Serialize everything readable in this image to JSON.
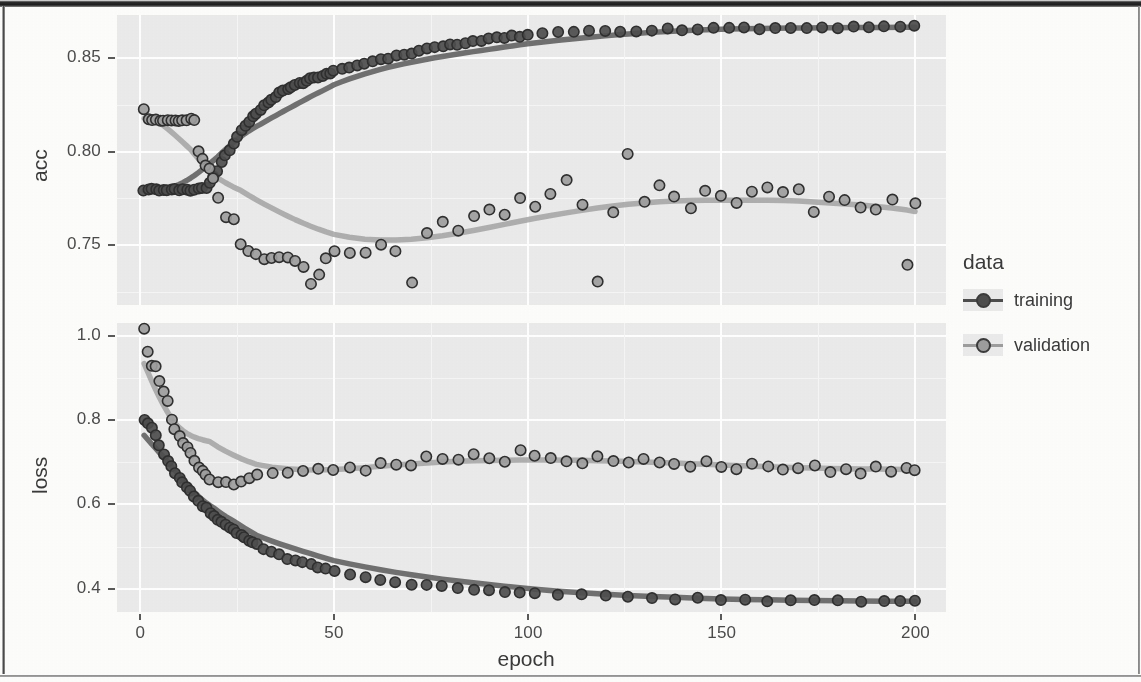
{
  "chart_data": {
    "type": "scatter",
    "title": "",
    "xlabel": "epoch",
    "facets": [
      {
        "name": "acc",
        "ylabel": "acc",
        "yticks": [
          "0.85",
          "0.80",
          "0.75"
        ],
        "ytick_values": [
          0.85,
          0.8,
          0.75
        ],
        "ylim": [
          0.718,
          0.873
        ],
        "series": [
          {
            "name": "training",
            "color": "#4d4d4d",
            "x": [
              1,
              2,
              3,
              4,
              5,
              6,
              7,
              8,
              9,
              10,
              11,
              12,
              13,
              14,
              15,
              16,
              17,
              18,
              19,
              20,
              21,
              22,
              23,
              24,
              25,
              26,
              27,
              28,
              29,
              30,
              31,
              32,
              33,
              34,
              35,
              36,
              37,
              38,
              39,
              40,
              41,
              42,
              43,
              44,
              45,
              46,
              47,
              48,
              49,
              50,
              52,
              54,
              56,
              58,
              60,
              62,
              64,
              66,
              68,
              70,
              72,
              74,
              76,
              78,
              80,
              82,
              84,
              86,
              88,
              90,
              92,
              94,
              96,
              98,
              100,
              104,
              108,
              112,
              116,
              120,
              124,
              128,
              132,
              136,
              140,
              144,
              148,
              152,
              156,
              160,
              164,
              168,
              172,
              176,
              180,
              184,
              188,
              192,
              196,
              200
            ],
            "y": [
              0.7795,
              0.7795,
              0.7795,
              0.7795,
              0.7795,
              0.7795,
              0.7795,
              0.7795,
              0.7795,
              0.7795,
              0.7795,
              0.7796,
              0.7797,
              0.7798,
              0.78,
              0.7803,
              0.781,
              0.7833,
              0.7866,
              0.79,
              0.7945,
              0.7984,
              0.801,
              0.804,
              0.8073,
              0.811,
              0.8135,
              0.8162,
              0.8185,
              0.8205,
              0.8228,
              0.8248,
              0.8265,
              0.828,
              0.8298,
              0.8312,
              0.8325,
              0.8336,
              0.8345,
              0.8354,
              0.8362,
              0.837,
              0.8378,
              0.8386,
              0.8392,
              0.8398,
              0.8405,
              0.8412,
              0.842,
              0.8428,
              0.844,
              0.8452,
              0.846,
              0.847,
              0.8478,
              0.8488,
              0.85,
              0.8512,
              0.8522,
              0.853,
              0.854,
              0.8548,
              0.8555,
              0.8562,
              0.857,
              0.8576,
              0.8582,
              0.8588,
              0.8593,
              0.86,
              0.8605,
              0.861,
              0.8614,
              0.8618,
              0.8622,
              0.8628,
              0.8633,
              0.8637,
              0.864,
              0.8643,
              0.8646,
              0.8648,
              0.865,
              0.8652,
              0.8654,
              0.8655,
              0.8657,
              0.8658,
              0.8659,
              0.866,
              0.8661,
              0.8662,
              0.8663,
              0.8664,
              0.8664,
              0.8665,
              0.8665,
              0.8666,
              0.8666,
              0.8667
            ]
          },
          {
            "name": "validation",
            "color": "#9d9d9d",
            "x": [
              1,
              2,
              3,
              4,
              5,
              6,
              7,
              8,
              9,
              10,
              11,
              12,
              13,
              14,
              15,
              16,
              17,
              18,
              19,
              20,
              22,
              24,
              26,
              28,
              30,
              32,
              34,
              36,
              38,
              40,
              42,
              44,
              46,
              48,
              50,
              54,
              58,
              62,
              66,
              70,
              74,
              78,
              82,
              86,
              90,
              94,
              98,
              102,
              106,
              110,
              114,
              118,
              122,
              126,
              130,
              134,
              138,
              142,
              146,
              150,
              154,
              158,
              162,
              166,
              170,
              174,
              178,
              182,
              186,
              190,
              194,
              198,
              200
            ],
            "y": [
              0.8225,
              0.817,
              0.817,
              0.817,
              0.817,
              0.817,
              0.817,
              0.817,
              0.817,
              0.817,
              0.817,
              0.817,
              0.817,
              0.8168,
              0.8,
              0.796,
              0.793,
              0.7905,
              0.786,
              0.7748,
              0.7643,
              0.7638,
              0.75,
              0.7468,
              0.745,
              0.743,
              0.743,
              0.743,
              0.7428,
              0.7415,
              0.739,
              0.7295,
              0.734,
              0.743,
              0.747,
              0.746,
              0.7455,
              0.75,
              0.747,
              0.73,
              0.756,
              0.762,
              0.758,
              0.765,
              0.769,
              0.766,
              0.775,
              0.771,
              0.777,
              0.785,
              0.772,
              0.73,
              0.768,
              0.799,
              0.773,
              0.782,
              0.776,
              0.77,
              0.779,
              0.776,
              0.773,
              0.778,
              0.781,
              0.778,
              0.78,
              0.768,
              0.776,
              0.774,
              0.77,
              0.769,
              0.774,
              0.74,
              0.772
            ]
          }
        ]
      },
      {
        "name": "loss",
        "ylabel": "loss",
        "yticks": [
          "1.0",
          "0.8",
          "0.6",
          "0.4"
        ],
        "ytick_values": [
          1.0,
          0.8,
          0.6,
          0.4
        ],
        "ylim": [
          0.345,
          1.03
        ],
        "series": [
          {
            "name": "training",
            "color": "#4d4d4d",
            "x": [
              1,
              2,
              3,
              4,
              5,
              6,
              7,
              8,
              9,
              10,
              11,
              12,
              13,
              14,
              15,
              16,
              17,
              18,
              19,
              20,
              21,
              22,
              23,
              24,
              25,
              26,
              27,
              28,
              29,
              30,
              32,
              34,
              36,
              38,
              40,
              42,
              44,
              46,
              48,
              50,
              54,
              58,
              62,
              66,
              70,
              74,
              78,
              82,
              86,
              90,
              94,
              98,
              102,
              108,
              114,
              120,
              126,
              132,
              138,
              144,
              150,
              156,
              162,
              168,
              174,
              180,
              186,
              192,
              196,
              200
            ],
            "y": [
              0.8,
              0.79,
              0.78,
              0.765,
              0.74,
              0.72,
              0.7,
              0.688,
              0.676,
              0.664,
              0.652,
              0.64,
              0.63,
              0.62,
              0.608,
              0.598,
              0.59,
              0.582,
              0.574,
              0.566,
              0.558,
              0.55,
              0.544,
              0.538,
              0.532,
              0.526,
              0.52,
              0.514,
              0.509,
              0.504,
              0.495,
              0.487,
              0.48,
              0.473,
              0.467,
              0.461,
              0.456,
              0.451,
              0.446,
              0.442,
              0.434,
              0.427,
              0.421,
              0.416,
              0.412,
              0.408,
              0.404,
              0.401,
              0.398,
              0.396,
              0.393,
              0.391,
              0.389,
              0.386,
              0.384,
              0.382,
              0.38,
              0.378,
              0.377,
              0.376,
              0.375,
              0.374,
              0.373,
              0.372,
              0.371,
              0.371,
              0.37,
              0.37,
              0.369,
              0.369
            ]
          },
          {
            "name": "validation",
            "color": "#9d9d9d",
            "x": [
              1,
              2,
              3,
              4,
              5,
              6,
              7,
              8,
              9,
              10,
              11,
              12,
              13,
              14,
              15,
              16,
              17,
              18,
              20,
              22,
              24,
              26,
              28,
              30,
              34,
              38,
              42,
              46,
              50,
              54,
              58,
              62,
              66,
              70,
              74,
              78,
              82,
              86,
              90,
              94,
              98,
              102,
              106,
              110,
              114,
              118,
              122,
              126,
              130,
              134,
              138,
              142,
              146,
              150,
              154,
              158,
              162,
              166,
              170,
              174,
              178,
              182,
              186,
              190,
              194,
              198,
              200
            ],
            "y": [
              1.015,
              0.96,
              0.93,
              0.925,
              0.895,
              0.87,
              0.845,
              0.8,
              0.78,
              0.76,
              0.745,
              0.735,
              0.72,
              0.705,
              0.69,
              0.678,
              0.668,
              0.66,
              0.655,
              0.652,
              0.648,
              0.655,
              0.66,
              0.668,
              0.672,
              0.676,
              0.68,
              0.682,
              0.684,
              0.69,
              0.682,
              0.7,
              0.695,
              0.69,
              0.715,
              0.71,
              0.705,
              0.72,
              0.71,
              0.7,
              0.73,
              0.718,
              0.708,
              0.705,
              0.7,
              0.715,
              0.705,
              0.7,
              0.71,
              0.7,
              0.695,
              0.69,
              0.7,
              0.688,
              0.685,
              0.695,
              0.69,
              0.68,
              0.688,
              0.692,
              0.678,
              0.685,
              0.675,
              0.69,
              0.68,
              0.685,
              0.682
            ]
          }
        ]
      }
    ],
    "xticks": [
      "0",
      "50",
      "100",
      "150",
      "200"
    ],
    "xtick_values": [
      0,
      50,
      100,
      150,
      200
    ],
    "xlim": [
      -6,
      208
    ],
    "grid": true,
    "legend": {
      "title": "data",
      "position": "right",
      "entries": [
        {
          "label": "training",
          "color": "#4d4d4d"
        },
        {
          "label": "validation",
          "color": "#9d9d9d"
        }
      ]
    },
    "panel_background": "#ebebeb",
    "gridline_color": "#ffffff"
  }
}
